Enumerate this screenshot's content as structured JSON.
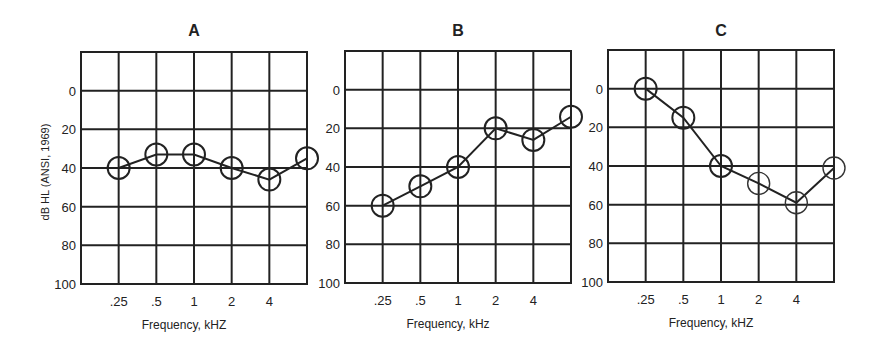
{
  "chart_data": [
    {
      "type": "line",
      "title": "A",
      "xlabel": "Frequency, kHZ",
      "ylabel": "dB HL (ANSI, 1969)",
      "categories": [
        ".25",
        ".5",
        "1",
        "2",
        "4",
        "8"
      ],
      "x_tick_labels": [
        ".25",
        ".5",
        "1",
        "2",
        "4",
        ""
      ],
      "y_tick_labels": [
        "0",
        "20",
        "40",
        "60",
        "80",
        "100"
      ],
      "ylim": [
        -20,
        100
      ],
      "y_inverted": true,
      "grid": true,
      "marker": "open-circle",
      "series": [
        {
          "name": "A",
          "values": [
            40,
            33,
            33,
            40,
            46,
            35
          ]
        }
      ]
    },
    {
      "type": "line",
      "title": "B",
      "xlabel": "Frequency, kHz",
      "ylabel": "",
      "categories": [
        ".25",
        ".5",
        "1",
        "2",
        "4",
        "8"
      ],
      "x_tick_labels": [
        ".25",
        ".5",
        "1",
        "2",
        "4",
        ""
      ],
      "y_tick_labels": [
        "0",
        "20",
        "40",
        "60",
        "80",
        "100"
      ],
      "ylim": [
        -20,
        100
      ],
      "y_inverted": true,
      "grid": true,
      "marker": "open-circle",
      "series": [
        {
          "name": "B",
          "values": [
            60,
            50,
            40,
            20,
            26,
            14
          ]
        }
      ]
    },
    {
      "type": "line",
      "title": "C",
      "xlabel": "Frequency, kHZ",
      "ylabel": "",
      "categories": [
        ".25",
        ".5",
        "1",
        "2",
        "4",
        "8"
      ],
      "x_tick_labels": [
        ".25",
        ".5",
        "1",
        "2",
        "4",
        ""
      ],
      "y_tick_labels": [
        "0",
        "20",
        "40",
        "60",
        "80",
        "100"
      ],
      "ylim": [
        -20,
        100
      ],
      "y_inverted": true,
      "grid": true,
      "marker": "open-circle",
      "series": [
        {
          "name": "C",
          "values": [
            0,
            15,
            40,
            49,
            59,
            41
          ]
        }
      ]
    }
  ],
  "colors": {
    "ink": "#222222",
    "background": "#ffffff"
  }
}
